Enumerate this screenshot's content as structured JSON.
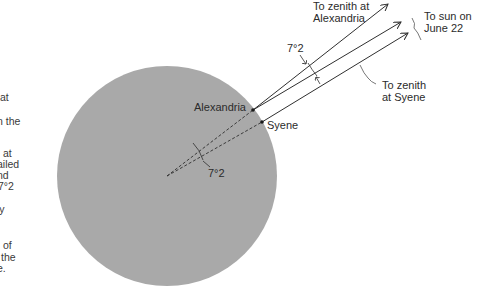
{
  "figure": {
    "colors": {
      "earth": "#a9a9a9",
      "line": "#2f2f2f",
      "background": "#ffffff"
    },
    "labels": {
      "zenith_alexandria": [
        "To zenith at",
        "Alexandria"
      ],
      "sun": [
        "To sun on",
        "June 22"
      ],
      "zenith_syene": [
        "To zenith",
        "at Syene"
      ],
      "angle_top": "7°2",
      "angle_center": "7°2",
      "alexandria": "Alexandria",
      "syene": "Syene"
    }
  },
  "side_text": {
    "fragments": [
      "at",
      "n the",
      "at",
      "ailed",
      "nd",
      "7°2",
      "ly",
      "of",
      "the",
      "e."
    ]
  }
}
